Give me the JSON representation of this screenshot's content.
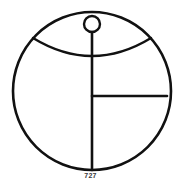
{
  "figure": {
    "caption": "727",
    "background_color": "#ffffff",
    "stroke_color": "#111111",
    "canvas": {
      "width": 181,
      "height": 191
    },
    "elements": {
      "outer_circle": {
        "name": "outer-circle",
        "cx": 92,
        "cy": 91,
        "r": 79,
        "stroke_width": 2.6
      },
      "small_circle": {
        "name": "small-circle",
        "cx": 92,
        "cy": 24,
        "r": 8,
        "stroke_width": 2.4
      },
      "arc": {
        "name": "curved-arc",
        "start_x": 33,
        "start_y": 38,
        "end_x": 151,
        "end_y": 38,
        "lowest_y": 56,
        "stroke_width": 2.4
      },
      "vertical_line": {
        "name": "vertical-line",
        "x": 92,
        "y_top": 32,
        "y_bottom": 170,
        "stroke_width": 2.6
      },
      "horizontal_line": {
        "name": "horizontal-line",
        "y": 96,
        "x_start": 92,
        "x_end": 167,
        "stroke_width": 2.6
      }
    }
  }
}
